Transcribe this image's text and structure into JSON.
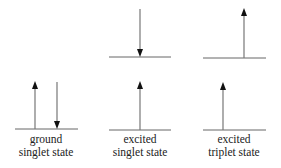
{
  "diagram": {
    "title": "",
    "colors": {
      "line": "#666666",
      "arrow_head": "#111111",
      "text": "#222222"
    },
    "states": [
      {
        "id": "ground-singlet",
        "label_line1": "ground",
        "label_line2": "singlet state",
        "levels": [
          {
            "level": "lower",
            "electrons": [
              "up",
              "down"
            ]
          }
        ]
      },
      {
        "id": "excited-singlet",
        "label_line1": "excited",
        "label_line2": "singlet state",
        "levels": [
          {
            "level": "upper",
            "electrons": [
              "down"
            ]
          },
          {
            "level": "lower",
            "electrons": [
              "up"
            ]
          }
        ]
      },
      {
        "id": "excited-triplet",
        "label_line1": "excited",
        "label_line2": "triplet state",
        "levels": [
          {
            "level": "upper",
            "electrons": [
              "up"
            ]
          },
          {
            "level": "lower",
            "electrons": [
              "up"
            ]
          }
        ]
      }
    ]
  }
}
